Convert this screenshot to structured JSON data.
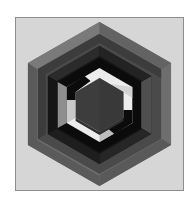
{
  "artwork": {
    "title": "Nested Hexagonal Spiral",
    "medium": "geometric print",
    "frame": {
      "background_color": "#d6d6d6",
      "border_color": "#8d8d8d",
      "page_color": "#ffffff"
    },
    "palette": {
      "background": "#d6d6d6",
      "mid_gray": "#6e6e6e",
      "dark_gray": "#4a4a4a",
      "near_black": "#151515",
      "black": "#0b0b0b",
      "white": "#ececec",
      "off_white": "#d8d8d8",
      "center_charcoal": "#3d3d3d",
      "shadow_gray": "#5a5a5a"
    },
    "geometry": {
      "center_x": 84,
      "center_y": 86,
      "outer_radius": 84,
      "ring_count": 6,
      "orientation": "pointy-left-right",
      "description": "Six concentric hexagonal bands forming an interlocking spiral maze"
    },
    "rings": [
      {
        "index": 0,
        "name": "outer-band-mid-gray",
        "radius": 84,
        "color": "#6e6e6e"
      },
      {
        "index": 1,
        "name": "band-dark-gray",
        "radius": 70,
        "color": "#4a4a4a"
      },
      {
        "index": 2,
        "name": "band-near-black",
        "radius": 58,
        "color": "#151515"
      },
      {
        "index": 3,
        "name": "band-black",
        "radius": 45,
        "color": "#0b0b0b"
      },
      {
        "index": 4,
        "name": "band-white",
        "radius": 33,
        "color": "#ececec"
      },
      {
        "index": 5,
        "name": "core-hexagon",
        "radius": 24,
        "color": "#3d3d3d"
      }
    ]
  }
}
